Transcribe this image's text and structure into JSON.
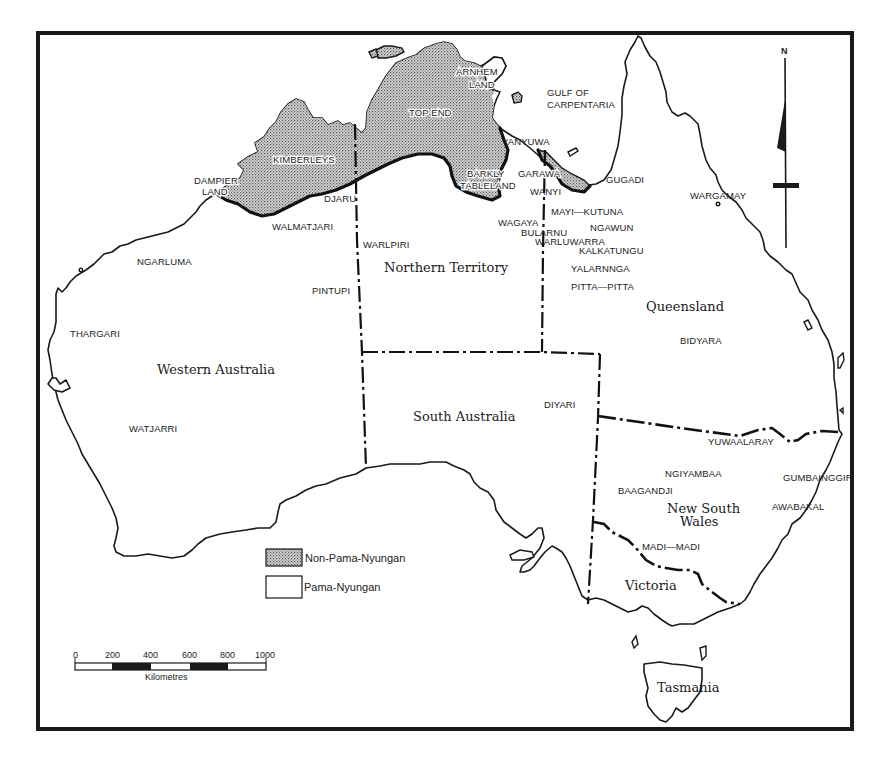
{
  "map": {
    "north_label": "N",
    "water_labels": {
      "gulf_line1": "GULF OF",
      "gulf_line2": "CARPENTARIA"
    },
    "regions": {
      "western_australia": "Western Australia",
      "northern_territory": "Northern Territory",
      "south_australia": "South Australia",
      "queensland": "Queensland",
      "nsw_line1": "New South",
      "nsw_line2": "Wales",
      "victoria": "Victoria",
      "tasmania": "Tasmania"
    },
    "non_pama_nyungan_labels": {
      "dampier_line1": "DAMPIER",
      "dampier_line2": "LAND",
      "kimberleys": "KIMBERLEYS",
      "top_end": "TOP END",
      "arnhem_line1": "ARNHEM",
      "arnhem_line2": "LAND",
      "barkly_line1": "BARKLY",
      "barkly_line2": "TABLELAND",
      "garawa": "GARAWA"
    },
    "languages": {
      "walmatjari": "WALMATJARI",
      "djaru": "DJARU",
      "warlpiri": "WARLPIRI",
      "yanyuwa": "YANYUWA",
      "wanyi": "WANYI",
      "wagaya": "WAGAYA",
      "bularnu": "BULARNU",
      "warluwarra": "WARLUWARRA",
      "gugadi": "GUGADI",
      "mayi_kutuna": "MAYI—KUTUNA",
      "ngawun": "NGAWUN",
      "kalkatungu": "KALKATUNGU",
      "yalarnnga": "YALARNNGA",
      "pitta_pitta": "PITTA—PITTA",
      "wargamay": "WARGAMAY",
      "ngarluma": "NGARLUMA",
      "pintupi": "PINTUPI",
      "thargari": "THARGARI",
      "watjarri": "WATJARRI",
      "bidyara": "BIDYARA",
      "diyari": "DIYARI",
      "yuwaalaray": "YUWAALARAY",
      "ngiyambaa": "NGIYAMBAA",
      "baagandji": "BAAGANDJI",
      "gumbainggir": "GUMBAINGGIR",
      "awabakal": "AWABAKAL",
      "madi_madi": "MADI—MADI"
    }
  },
  "legend": {
    "items": [
      {
        "label": "Non-Pama-Nyungan",
        "pattern": "stipple"
      },
      {
        "label": "Pama-Nyungan",
        "pattern": "blank"
      }
    ]
  },
  "scale_bar": {
    "ticks": [
      "0",
      "200",
      "400",
      "600",
      "800",
      "1000"
    ],
    "unit": "Kilometres"
  },
  "colors": {
    "ink": "#1a1a1a",
    "stipple": "#9a9a9a",
    "paper": "#ffffff"
  }
}
